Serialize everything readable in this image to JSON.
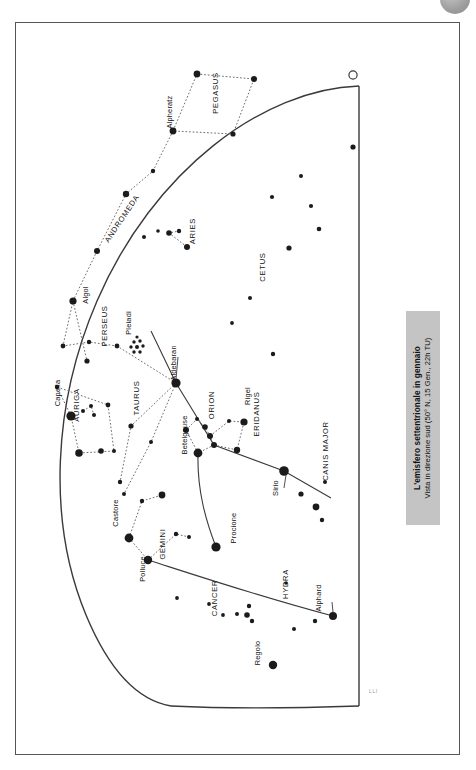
{
  "figure": {
    "kind": "star-chart",
    "caption_title": "L'emisfero settentrionale in gennaio",
    "caption_subtitle": "Vista in direzione sud (50° N, 15 Gen., 22h TU)",
    "corner_mark": "LLI",
    "page_badge": "",
    "colors": {
      "star": "#1b1b1b",
      "line_constellation": "#6e6e6e",
      "line_horizon": "#3a3a3a",
      "line_ecliptic": "#3a3a3a",
      "caption_bg": "#c4c4c4",
      "frame": "#555555",
      "badge": "#9e9e9e"
    },
    "markers": {
      "zenith_marker": "open-circle",
      "cluster_pleiades": "star-cluster"
    }
  },
  "chart_data": {
    "type": "scatter",
    "title": "L'emisfero settentrionale in gennaio",
    "subtitle": "Vista in direzione sud (50° N, 15 Gen., 22h TU)",
    "xlabel": "",
    "ylabel": "",
    "grid": false,
    "legend": "none",
    "projection": "quarter-dome horizon view facing south",
    "constellation_labels": [
      {
        "name": "PEGASUS",
        "x": 217,
        "y": 92,
        "rot": -90
      },
      {
        "name": "ANDROMEDA",
        "x": 123,
        "y": 219,
        "rot": -56
      },
      {
        "name": "ARIES",
        "x": 194,
        "y": 230,
        "rot": -90
      },
      {
        "name": "CETUS",
        "x": 264,
        "y": 266,
        "rot": -90
      },
      {
        "name": "PERSEUS",
        "x": 106,
        "y": 325,
        "rot": -90
      },
      {
        "name": "AURIGA",
        "x": 78,
        "y": 404,
        "rot": -90
      },
      {
        "name": "TAURUS",
        "x": 138,
        "y": 397,
        "rot": -90
      },
      {
        "name": "ORION",
        "x": 213,
        "y": 404,
        "rot": -90
      },
      {
        "name": "ERIDANUS",
        "x": 258,
        "y": 413,
        "rot": -90
      },
      {
        "name": "CANIS MAJOR",
        "x": 327,
        "y": 450,
        "rot": -90
      },
      {
        "name": "GEMINI",
        "x": 164,
        "y": 543,
        "rot": -90
      },
      {
        "name": "CANCER",
        "x": 216,
        "y": 597,
        "rot": -90
      },
      {
        "name": "HYDRA",
        "x": 287,
        "y": 583,
        "rot": -90
      }
    ],
    "star_labels": [
      {
        "name": "Alpheratz",
        "x": 171,
        "y": 111,
        "rot": -90
      },
      {
        "name": "Algol",
        "x": 87,
        "y": 294,
        "rot": -90
      },
      {
        "name": "Pleiadi",
        "x": 130,
        "y": 322,
        "rot": -90
      },
      {
        "name": "Capella",
        "x": 59,
        "y": 392,
        "rot": -90
      },
      {
        "name": "Aldebaran",
        "x": 175,
        "y": 362,
        "rot": -90
      },
      {
        "name": "Betelgeuse",
        "x": 186,
        "y": 434,
        "rot": -90
      },
      {
        "name": "Rigel",
        "x": 249,
        "y": 395,
        "rot": -90
      },
      {
        "name": "Sirio",
        "x": 277,
        "y": 487,
        "rot": -90
      },
      {
        "name": "Procione",
        "x": 235,
        "y": 527,
        "rot": -90
      },
      {
        "name": "Castore",
        "x": 117,
        "y": 512,
        "rot": -90
      },
      {
        "name": "Polluce",
        "x": 144,
        "y": 568,
        "rot": -90
      },
      {
        "name": "Alphard",
        "x": 320,
        "y": 597,
        "rot": -90
      },
      {
        "name": "Regolo",
        "x": 259,
        "y": 652,
        "rot": -90
      }
    ],
    "stars": [
      {
        "x": 196,
        "y": 73,
        "r": 3.4
      },
      {
        "x": 253,
        "y": 78,
        "r": 3.0
      },
      {
        "x": 172,
        "y": 130,
        "r": 3.4
      },
      {
        "x": 232,
        "y": 133,
        "r": 2.6
      },
      {
        "x": 152,
        "y": 170,
        "r": 2.2
      },
      {
        "x": 125,
        "y": 193,
        "r": 3.2
      },
      {
        "x": 352,
        "y": 146,
        "r": 2.6
      },
      {
        "x": 300,
        "y": 175,
        "r": 2.0
      },
      {
        "x": 310,
        "y": 205,
        "r": 2.1
      },
      {
        "x": 318,
        "y": 228,
        "r": 2.3
      },
      {
        "x": 288,
        "y": 247,
        "r": 2.6
      },
      {
        "x": 271,
        "y": 196,
        "r": 2.1
      },
      {
        "x": 168,
        "y": 232,
        "r": 2.8
      },
      {
        "x": 178,
        "y": 230,
        "r": 2.2
      },
      {
        "x": 186,
        "y": 246,
        "r": 3.0
      },
      {
        "x": 143,
        "y": 236,
        "r": 2.0
      },
      {
        "x": 157,
        "y": 230,
        "r": 1.8
      },
      {
        "x": 96,
        "y": 250,
        "r": 3.0
      },
      {
        "x": 249,
        "y": 297,
        "r": 2.0
      },
      {
        "x": 231,
        "y": 322,
        "r": 1.9
      },
      {
        "x": 72,
        "y": 300,
        "r": 3.6
      },
      {
        "x": 62,
        "y": 345,
        "r": 2.4
      },
      {
        "x": 88,
        "y": 341,
        "r": 2.2
      },
      {
        "x": 116,
        "y": 345,
        "r": 2.4
      },
      {
        "x": 86,
        "y": 360,
        "r": 2.6
      },
      {
        "x": 56,
        "y": 386,
        "r": 2.2
      },
      {
        "x": 70,
        "y": 415,
        "r": 4.6
      },
      {
        "x": 82,
        "y": 410,
        "r": 2.0
      },
      {
        "x": 90,
        "y": 405,
        "r": 2.0
      },
      {
        "x": 93,
        "y": 414,
        "r": 2.0
      },
      {
        "x": 107,
        "y": 404,
        "r": 2.4
      },
      {
        "x": 78,
        "y": 452,
        "r": 3.8
      },
      {
        "x": 100,
        "y": 450,
        "r": 2.8
      },
      {
        "x": 113,
        "y": 450,
        "r": 2.0
      },
      {
        "x": 175,
        "y": 382,
        "r": 4.6
      },
      {
        "x": 130,
        "y": 425,
        "r": 2.6
      },
      {
        "x": 150,
        "y": 441,
        "r": 2.0
      },
      {
        "x": 119,
        "y": 481,
        "r": 2.2
      },
      {
        "x": 123,
        "y": 493,
        "r": 2.0
      },
      {
        "x": 196,
        "y": 418,
        "r": 2.0
      },
      {
        "x": 204,
        "y": 426,
        "r": 2.8
      },
      {
        "x": 209,
        "y": 435,
        "r": 3.0
      },
      {
        "x": 213,
        "y": 444,
        "r": 3.0
      },
      {
        "x": 228,
        "y": 420,
        "r": 2.0
      },
      {
        "x": 243,
        "y": 421,
        "r": 3.6
      },
      {
        "x": 236,
        "y": 449,
        "r": 3.2
      },
      {
        "x": 197,
        "y": 452,
        "r": 4.4
      },
      {
        "x": 185,
        "y": 429,
        "r": 3.0
      },
      {
        "x": 272,
        "y": 353,
        "r": 2.2
      },
      {
        "x": 283,
        "y": 470,
        "r": 4.8
      },
      {
        "x": 300,
        "y": 493,
        "r": 2.6
      },
      {
        "x": 315,
        "y": 506,
        "r": 3.4
      },
      {
        "x": 321,
        "y": 519,
        "r": 2.2
      },
      {
        "x": 324,
        "y": 481,
        "r": 2.0
      },
      {
        "x": 215,
        "y": 546,
        "r": 4.6
      },
      {
        "x": 128,
        "y": 537,
        "r": 4.4
      },
      {
        "x": 147,
        "y": 559,
        "r": 4.2
      },
      {
        "x": 141,
        "y": 500,
        "r": 2.2
      },
      {
        "x": 161,
        "y": 494,
        "r": 3.4
      },
      {
        "x": 175,
        "y": 533,
        "r": 2.2
      },
      {
        "x": 188,
        "y": 536,
        "r": 2.0
      },
      {
        "x": 176,
        "y": 597,
        "r": 1.9
      },
      {
        "x": 208,
        "y": 603,
        "r": 1.9
      },
      {
        "x": 222,
        "y": 614,
        "r": 1.9
      },
      {
        "x": 236,
        "y": 613,
        "r": 2.0
      },
      {
        "x": 246,
        "y": 614,
        "r": 2.8
      },
      {
        "x": 251,
        "y": 620,
        "r": 2.2
      },
      {
        "x": 248,
        "y": 605,
        "r": 2.2
      },
      {
        "x": 272,
        "y": 664,
        "r": 4.2
      },
      {
        "x": 293,
        "y": 628,
        "r": 2.0
      },
      {
        "x": 314,
        "y": 620,
        "r": 2.2
      },
      {
        "x": 332,
        "y": 615,
        "r": 4.0
      },
      {
        "x": 285,
        "y": 582,
        "r": 1.8
      }
    ]
  }
}
